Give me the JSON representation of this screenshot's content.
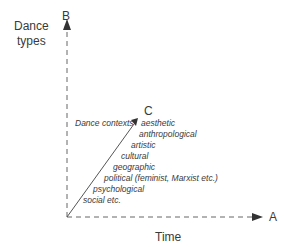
{
  "diagram": {
    "axes": {
      "b": {
        "letter": "B",
        "label_line1": "Dance",
        "label_line2": "types"
      },
      "a": {
        "letter": "A",
        "label": "Time"
      },
      "c": {
        "letter": "C",
        "label": "Dance contexts"
      }
    },
    "contexts": [
      "aesthetic",
      "anthropological",
      "artistic",
      "cultural",
      "geographic",
      "political (feminist, Marxist etc.)",
      "psychological",
      "social etc."
    ],
    "colors": {
      "line": "#555555",
      "text": "#3a3a3a"
    }
  }
}
